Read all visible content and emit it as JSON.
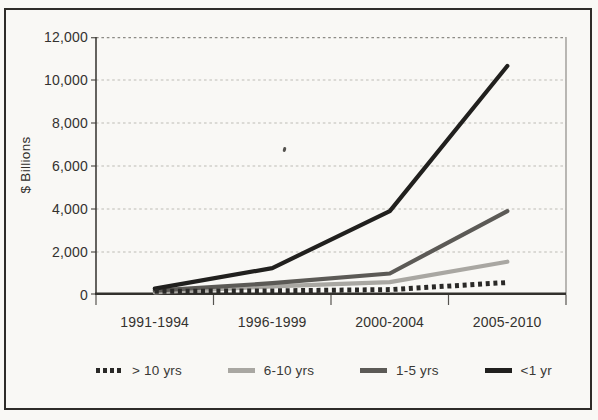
{
  "figure": {
    "background": "#f9f8f5",
    "frame_border": "#2e2c29"
  },
  "chart_data": {
    "type": "line",
    "title": "",
    "xlabel": "",
    "ylabel": "$ Billions",
    "categories": [
      "1991-1994",
      "1996-1999",
      "2000-2004",
      "2005-2010"
    ],
    "series": [
      {
        "name": "> 10 yrs",
        "style": "dotted",
        "color": "#2a2927",
        "values": [
          170,
          190,
          250,
          580
        ]
      },
      {
        "name": "6-10 yrs",
        "style": "solid",
        "color": "#a9a7a2",
        "values": [
          120,
          400,
          600,
          1550
        ]
      },
      {
        "name": "1-5 yrs",
        "style": "solid",
        "color": "#5c5a56",
        "values": [
          200,
          550,
          1000,
          3900
        ]
      },
      {
        "name": "<1 yr",
        "style": "solid",
        "color": "#21201e",
        "values": [
          300,
          1250,
          3900,
          10650
        ]
      }
    ],
    "ylim": [
      0,
      12000
    ],
    "ytick_interval": 2000,
    "ytick_labels": [
      "0",
      "2,000",
      "4,000",
      "6,000",
      "8,000",
      "10,000",
      "12,000"
    ],
    "grid": true,
    "legend_position": "bottom"
  }
}
